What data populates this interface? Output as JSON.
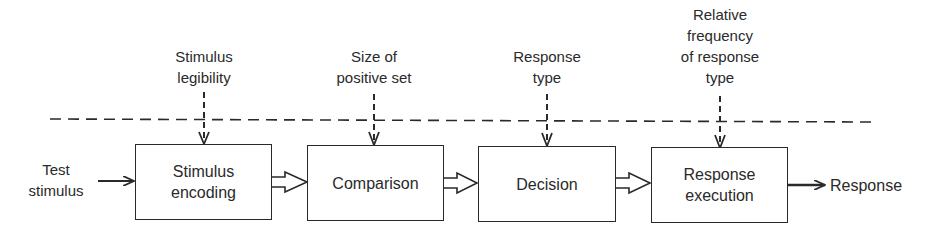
{
  "diagram": {
    "type": "flow",
    "input": {
      "label": "Test\nstimulus"
    },
    "output": {
      "label": "Response"
    },
    "stages": [
      {
        "id": "encoding",
        "label": "Stimulus\nencoding",
        "factor": "Stimulus\nlegibility"
      },
      {
        "id": "comparison",
        "label": "Comparison",
        "factor": "Size of\npositive set"
      },
      {
        "id": "decision",
        "label": "Decision",
        "factor": "Response\ntype"
      },
      {
        "id": "execution",
        "label": "Response\nexecution",
        "factor": "Relative\nfrequency\nof response\ntype"
      }
    ],
    "colors": {
      "stroke": "#2a2a2a",
      "background": "#ffffff"
    }
  }
}
